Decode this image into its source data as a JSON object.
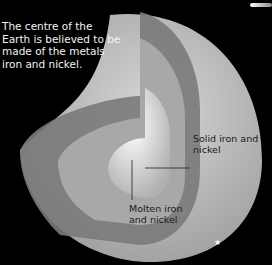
{
  "intro_text": "The centre of the Earth is believed to be made of the metals iron and nickel.",
  "labels": {
    "solid_core": "Solid iron and nickel",
    "molten_core": "Molten iron and nickel"
  },
  "colors": {
    "background": "#000000",
    "surface": "#bdbdbd",
    "mantle": "#7a7a7a",
    "outer_core": "#a8a8a8",
    "inner_core": "#e6e6e6"
  }
}
